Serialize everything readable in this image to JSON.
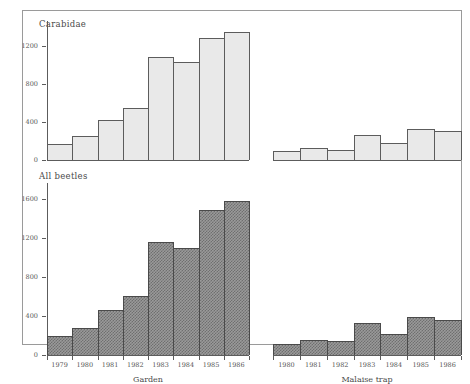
{
  "figure": {
    "panels": [
      {
        "id": "carabidae",
        "title": "Carabidae"
      },
      {
        "id": "all-beetles",
        "title": "All beetles"
      }
    ],
    "group_labels": [
      "Garden",
      "Malaise trap"
    ]
  },
  "chart_data": {
    "type": "bar",
    "title": "",
    "xlabel": "",
    "ylabel": "",
    "grid": false,
    "legend": "none",
    "panels": [
      {
        "name": "Carabidae",
        "ylim": [
          0,
          1400
        ],
        "yticks": [
          0,
          400,
          800,
          1200
        ],
        "ytick_labels": [
          "0",
          "400",
          "800",
          "1200"
        ],
        "groups": [
          {
            "name": "Garden",
            "categories": [
              "1979",
              "1980",
              "1981",
              "1982",
              "1983",
              "1984",
              "1985",
              "1986"
            ],
            "values": [
              165,
              250,
              420,
              550,
              1080,
              1030,
              1280,
              1350
            ]
          },
          {
            "name": "Malaise trap",
            "categories": [
              "1980",
              "1981",
              "1982",
              "1983",
              "1984",
              "1985",
              "1986"
            ],
            "values": [
              90,
              125,
              110,
              265,
              175,
              330,
              305
            ]
          }
        ]
      },
      {
        "name": "All beetles",
        "ylim": [
          0,
          1700
        ],
        "yticks": [
          0,
          400,
          800,
          1200,
          1600
        ],
        "ytick_labels": [
          "0",
          "400",
          "800",
          "1200",
          "1600"
        ],
        "groups": [
          {
            "name": "Garden",
            "categories": [
              "1979",
              "1980",
              "1981",
              "1982",
              "1983",
              "1984",
              "1985",
              "1986"
            ],
            "values": [
              195,
              280,
              460,
              600,
              1160,
              1100,
              1480,
              1580
            ]
          },
          {
            "name": "Malaise trap",
            "categories": [
              "1980",
              "1981",
              "1982",
              "1983",
              "1984",
              "1985",
              "1986"
            ],
            "values": [
              110,
              155,
              140,
              330,
              215,
              390,
              360
            ]
          }
        ]
      }
    ]
  }
}
